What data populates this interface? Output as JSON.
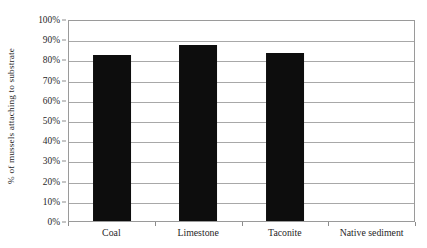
{
  "chart_data": {
    "type": "bar",
    "title": "",
    "subtitle": "",
    "categories": [
      "Coal",
      "Limestone",
      "Taconite",
      "Native sediment"
    ],
    "values": [
      82,
      87,
      83,
      0
    ],
    "xlabel": "",
    "ylabel": "% of mussels attaching to substrate",
    "ylim": [
      0,
      100
    ],
    "yticks": [
      0,
      10,
      20,
      30,
      40,
      50,
      60,
      70,
      80,
      90,
      100
    ],
    "ytick_labels": [
      "0%",
      "10%",
      "20%",
      "30%",
      "40%",
      "50%",
      "60%",
      "70%",
      "80%",
      "90%",
      "100%"
    ],
    "grid": true,
    "grid_axis": "y",
    "legend": false,
    "legend_position": "none",
    "bar_color": "#0d0d0d",
    "gridline_color": "#a8a8a8",
    "axis_color": "#9a9a9a",
    "background_color": "#ffffff",
    "series": [
      {
        "name": "% of mussels attaching to substrate",
        "values": [
          82,
          87,
          83,
          0
        ]
      }
    ],
    "points": [
      {
        "category": "Coal",
        "value": 82,
        "label": "82%"
      },
      {
        "category": "Limestone",
        "value": 87,
        "label": "87%"
      },
      {
        "category": "Taconite",
        "value": 83,
        "label": "83%"
      },
      {
        "category": "Native sediment",
        "value": 0,
        "label": "0%"
      }
    ]
  }
}
